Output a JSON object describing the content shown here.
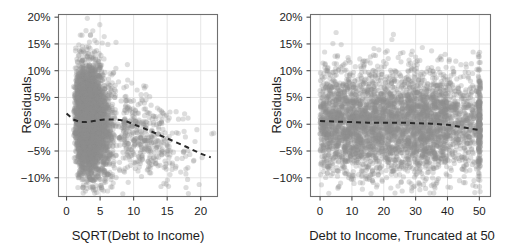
{
  "figure": {
    "type": "residual-scatter-panels",
    "background": "#ffffff",
    "point_color": "#8e8e8e",
    "trend_color": "#2a2a2a",
    "grid_color": "#e2e2e2",
    "frame_color": "#6f6f6f"
  },
  "chart_data": [
    {
      "type": "scatter",
      "title": "",
      "xlabel": "SQRT(Debt to Income)",
      "ylabel": "Residuals",
      "xlim": [
        -1.2,
        22.5
      ],
      "ylim": [
        -0.135,
        0.205
      ],
      "xticks": [
        0,
        5,
        10,
        15,
        20
      ],
      "xticklabels": [
        "0",
        "5",
        "10",
        "15",
        "20"
      ],
      "yticks": [
        0.2,
        0.15,
        0.1,
        0.05,
        0.0,
        -0.05,
        -0.1
      ],
      "yticklabels": [
        "20%",
        "15%",
        "10%",
        "5%",
        "0%",
        "-5%",
        "-10%"
      ],
      "grid": true,
      "legend": "none",
      "marker": {
        "shape": "circle",
        "radius": 2.6,
        "alpha": 0.3
      },
      "trend_line": {
        "style": "dashed",
        "x": [
          0,
          1,
          2,
          3,
          4,
          5,
          6,
          7,
          8,
          9,
          10,
          12,
          14,
          16,
          18,
          20,
          21.5
        ],
        "y": [
          0.02,
          0.009,
          0.004,
          0.004,
          0.006,
          0.008,
          0.009,
          0.009,
          0.008,
          0.005,
          0.0,
          -0.01,
          -0.021,
          -0.032,
          -0.043,
          -0.055,
          -0.062
        ]
      },
      "cluster": {
        "description": "dense teardrop cluster of residuals concentrated between x=0 and x=8, widest near x=4-5, with sparse outliers extending to x=22",
        "core_x_range": [
          0,
          8.5
        ],
        "core_y_range": [
          -0.105,
          0.175
        ],
        "n_points_approx": 9500
      }
    },
    {
      "type": "scatter",
      "title": "",
      "xlabel": "Debt to Income, Truncated at 50",
      "ylabel": "Residuals",
      "xlim": [
        -3.0,
        53.5
      ],
      "ylim": [
        -0.135,
        0.205
      ],
      "xticks": [
        0,
        10,
        20,
        30,
        40,
        50
      ],
      "xticklabels": [
        "0",
        "10",
        "20",
        "30",
        "40",
        "50"
      ],
      "yticks": [
        0.2,
        0.15,
        0.1,
        0.05,
        0.0,
        -0.05,
        -0.1
      ],
      "yticklabels": [
        "20%",
        "15%",
        "10%",
        "5%",
        "0%",
        "-5%",
        "-10%"
      ],
      "grid": true,
      "legend": "none",
      "marker": {
        "shape": "circle",
        "radius": 2.6,
        "alpha": 0.3
      },
      "trend_line": {
        "style": "dashed",
        "x": [
          0,
          5,
          10,
          15,
          20,
          25,
          30,
          35,
          40,
          45,
          50
        ],
        "y": [
          0.006,
          0.005,
          0.004,
          0.003,
          0.003,
          0.003,
          0.002,
          0.001,
          -0.001,
          -0.006,
          -0.011
        ]
      },
      "cluster": {
        "description": "broad uniform band of residuals from x=0 to x=40 spanning about -10% to +15%, thinning after x=40, with a dense vertical pile-up at the truncation value x=50",
        "core_x_range": [
          0,
          40
        ],
        "core_y_range": [
          -0.095,
          0.145
        ],
        "truncation_spike_x": 50,
        "n_points_approx": 9500
      }
    }
  ]
}
